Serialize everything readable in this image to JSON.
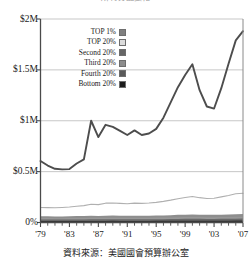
{
  "title": "所得分配變化",
  "caption": "資料來源：美國國會預算辦公室",
  "legend": {
    "items": [
      {
        "label": "TOP 1%",
        "color": "#808080"
      },
      {
        "label": "TOP 20%",
        "color": "#dcdcdc"
      },
      {
        "label": "Second 20%",
        "color": "#666666"
      },
      {
        "label": "Third 20%",
        "color": "#8c8c8c"
      },
      {
        "label": "Fourth 20%",
        "color": "#5a5a5a"
      },
      {
        "label": "Bottom 20%",
        "color": "#1c1c1c"
      }
    ]
  },
  "chart_data": {
    "type": "line",
    "title": "所得分配變化",
    "xlabel": "",
    "ylabel": "",
    "xlim": [
      1979,
      2007
    ],
    "ylim": [
      0,
      2000000
    ],
    "grid": true,
    "legend_position": "upper-left-inside",
    "ytick_labels": [
      "$2M",
      "$1.5M",
      "$1M",
      "$0.5M",
      "0%"
    ],
    "ytick_values": [
      2000000,
      1500000,
      1000000,
      500000,
      0
    ],
    "xtick_labels": [
      "'79",
      "'83",
      "'87",
      "'91",
      "'95",
      "'99",
      "'03",
      "'07"
    ],
    "xtick_values": [
      1979,
      1983,
      1987,
      1991,
      1995,
      1999,
      2003,
      2007
    ],
    "x": [
      1979,
      1980,
      1981,
      1982,
      1983,
      1984,
      1985,
      1986,
      1987,
      1988,
      1989,
      1990,
      1991,
      1992,
      1993,
      1994,
      1995,
      1996,
      1997,
      1998,
      1999,
      2000,
      2001,
      2002,
      2003,
      2004,
      2005,
      2006,
      2007
    ],
    "series": [
      {
        "name": "TOP 1%",
        "color": "#4d4d4d",
        "values": [
          605000,
          560000,
          528000,
          522000,
          525000,
          580000,
          620000,
          1000000,
          840000,
          960000,
          940000,
          900000,
          860000,
          905000,
          860000,
          875000,
          920000,
          1030000,
          1180000,
          1330000,
          1450000,
          1555000,
          1300000,
          1140000,
          1120000,
          1320000,
          1560000,
          1790000,
          1880000
        ]
      },
      {
        "name": "TOP 20%",
        "color": "#b0b0b0",
        "values": [
          148000,
          146000,
          145000,
          148000,
          152000,
          160000,
          166000,
          180000,
          176000,
          190000,
          192000,
          188000,
          184000,
          190000,
          188000,
          192000,
          198000,
          208000,
          220000,
          234000,
          246000,
          256000,
          244000,
          236000,
          238000,
          252000,
          266000,
          282000,
          288000
        ]
      },
      {
        "name": "Second 20%",
        "color": "#7a7a7a",
        "values": [
          62000,
          61000,
          60000,
          60000,
          61000,
          63000,
          64000,
          66000,
          65000,
          67000,
          68000,
          67000,
          66000,
          67000,
          66000,
          67000,
          68000,
          70000,
          72000,
          75000,
          77000,
          79000,
          77000,
          75000,
          75000,
          77000,
          79000,
          82000,
          83000
        ]
      },
      {
        "name": "Third 20%",
        "color": "#9a9a9a",
        "values": [
          44000,
          43000,
          42500,
          42500,
          43000,
          44000,
          45000,
          46000,
          45500,
          47000,
          47500,
          47000,
          46500,
          47000,
          46500,
          47000,
          48000,
          49000,
          50000,
          52000,
          53000,
          54000,
          53000,
          52000,
          52000,
          53000,
          54000,
          56000,
          57000
        ]
      },
      {
        "name": "Fourth 20%",
        "color": "#5f5f5f",
        "values": [
          30000,
          29500,
          29000,
          29000,
          29500,
          30000,
          30500,
          31000,
          31000,
          32000,
          32500,
          32000,
          31500,
          32000,
          31500,
          32000,
          32500,
          33000,
          34000,
          35000,
          36000,
          36500,
          36000,
          35500,
          35500,
          36000,
          37000,
          38000,
          38500
        ]
      },
      {
        "name": "Bottom 20%",
        "color": "#2b2b2b",
        "values": [
          15000,
          14800,
          14500,
          14300,
          14500,
          14800,
          15000,
          15300,
          15300,
          15800,
          16000,
          15800,
          15500,
          15800,
          15500,
          15800,
          16000,
          16300,
          16800,
          17300,
          17800,
          18000,
          17600,
          17300,
          17300,
          17600,
          18000,
          18500,
          18800
        ]
      }
    ]
  }
}
